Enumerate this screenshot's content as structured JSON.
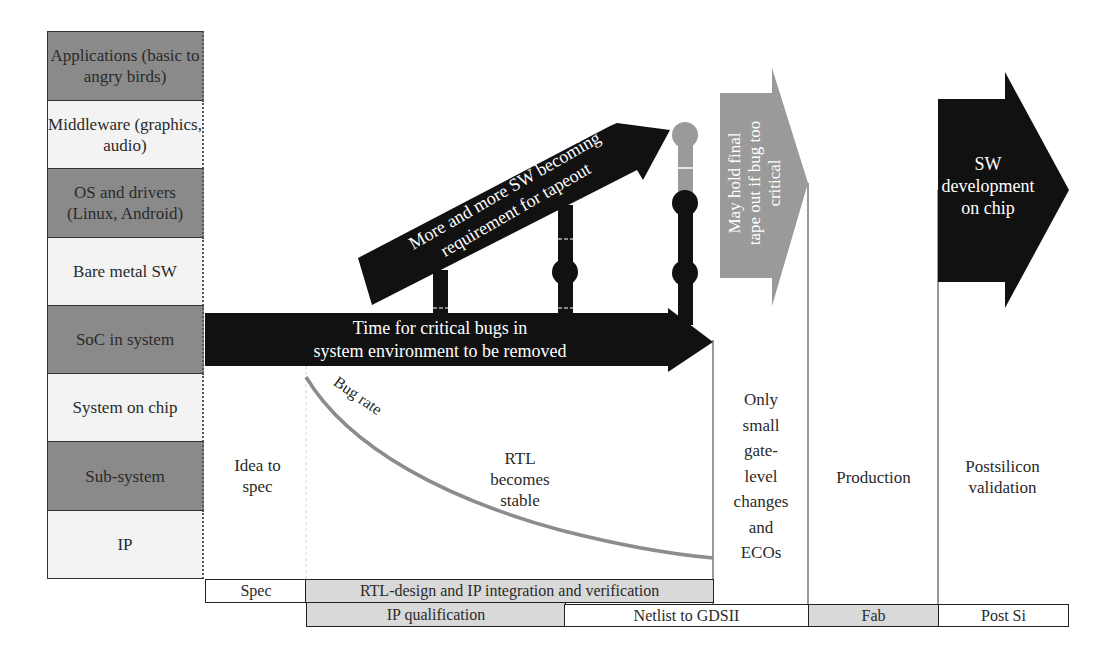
{
  "layers": [
    {
      "label": "Applications (basic to angry birds)",
      "shade": "dark"
    },
    {
      "label": "Middleware (graphics, audio)",
      "shade": "light"
    },
    {
      "label": "OS and drivers (Linux, Android)",
      "shade": "dark"
    },
    {
      "label": "Bare metal SW",
      "shade": "light"
    },
    {
      "label": "SoC in system",
      "shade": "dark"
    },
    {
      "label": "System on chip",
      "shade": "light"
    },
    {
      "label": "Sub-system",
      "shade": "dark"
    },
    {
      "label": "IP",
      "shade": "light"
    }
  ],
  "arrows": {
    "critical_bugs": "Time for critical bugs in system environment to be removed",
    "critical_bugs_line1": "Time for critical bugs in",
    "critical_bugs_line2": "system environment to be removed",
    "more_sw_line1": "More and more SW becoming",
    "more_sw_line2": "requirement for tapeout",
    "hold_tapeout_line1": "May hold final",
    "hold_tapeout_line2": "tape out if bug too",
    "hold_tapeout_line3": "critical",
    "sw_dev_line1": "SW",
    "sw_dev_line2": "development",
    "sw_dev_line3": "on chip"
  },
  "curve": {
    "label": "Bug rate"
  },
  "phases": {
    "idea_line1": "Idea to",
    "idea_line2": "spec",
    "rtl_line1": "RTL",
    "rtl_line2": "becomes",
    "rtl_line3": "stable",
    "eco_lines": [
      "Only",
      "small",
      "gate-",
      "level",
      "changes",
      "and",
      "ECOs"
    ],
    "production": "Production",
    "postsi_line1": "Postsilicon",
    "postsi_line2": "validation"
  },
  "timeline_row1": [
    {
      "label": "Spec",
      "shade": "white"
    },
    {
      "label": "RTL-design and IP integration and verification",
      "shade": "grey"
    }
  ],
  "timeline_row2": [
    {
      "label": "IP qualification",
      "shade": "grey"
    },
    {
      "label": "Netlist to GDSII",
      "shade": "white"
    },
    {
      "label": "Fab",
      "shade": "grey"
    },
    {
      "label": "Post Si",
      "shade": "white"
    }
  ],
  "colors": {
    "dark_layer": "#8a8a8a",
    "light_layer": "#f3f3f3",
    "arrow_black": "#111111",
    "arrow_grey": "#9a9a9a",
    "curve": "#8c8c8c",
    "bar_grey": "#d9d9d9"
  }
}
